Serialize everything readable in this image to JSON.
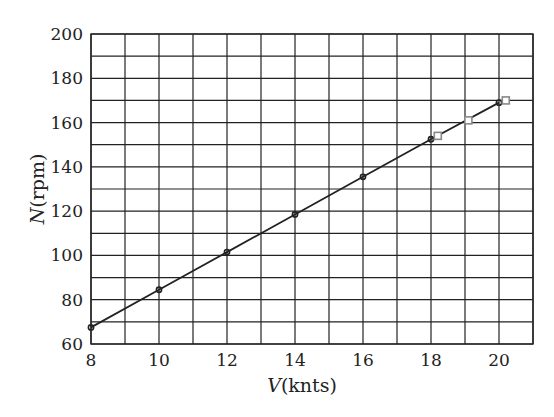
{
  "chart_data": {
    "type": "line",
    "title": "",
    "xlabel": "V(knts)",
    "xlabel_var": "V",
    "xlabel_unit": "(knts)",
    "ylabel": "N(rpm)",
    "ylabel_var": "N",
    "ylabel_unit": "(rpm)",
    "xlim": [
      8,
      21
    ],
    "ylim": [
      60,
      200
    ],
    "x_ticks": [
      8,
      10,
      12,
      14,
      16,
      18,
      20
    ],
    "y_ticks": [
      60,
      80,
      100,
      120,
      140,
      160,
      180,
      200
    ],
    "x_tick_labels": [
      "8",
      "10",
      "12",
      "14",
      "16",
      "18",
      "20"
    ],
    "y_tick_labels": [
      "60",
      "80",
      "100",
      "120",
      "140",
      "160",
      "180",
      "200"
    ],
    "x_grid_step": 1,
    "y_grid_step": 10,
    "grid": true,
    "legend": null,
    "series": [
      {
        "name": "fitted-line-circles",
        "marker": "circle",
        "line": true,
        "x": [
          8,
          10,
          12,
          14,
          16,
          18,
          20
        ],
        "y": [
          67.5,
          84.5,
          101.5,
          118.5,
          135.5,
          152.5,
          169
        ]
      },
      {
        "name": "measured-squares",
        "marker": "square",
        "line": false,
        "x": [
          18.2,
          19.1,
          20.2
        ],
        "y": [
          154,
          161,
          170
        ]
      }
    ]
  }
}
